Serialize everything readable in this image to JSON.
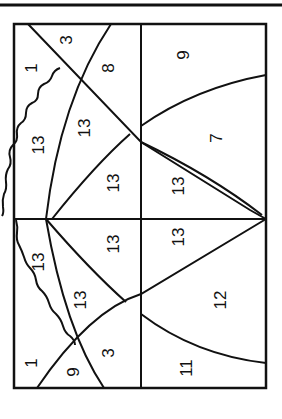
{
  "diagram": {
    "type": "quilt-block-pattern",
    "orientation": "rotated-90",
    "line_color": "#111111",
    "background": "#ffffff",
    "regions": [
      {
        "id": "r1",
        "label": "3",
        "x": 68,
        "y": 40
      },
      {
        "id": "r2",
        "label": "1",
        "x": 33,
        "y": 68
      },
      {
        "id": "r3",
        "label": "8",
        "x": 110,
        "y": 68
      },
      {
        "id": "r4",
        "label": "9",
        "x": 185,
        "y": 55
      },
      {
        "id": "r5",
        "label": "13",
        "x": 40,
        "y": 145
      },
      {
        "id": "r6",
        "label": "13",
        "x": 86,
        "y": 128
      },
      {
        "id": "r7",
        "label": "7",
        "x": 218,
        "y": 138
      },
      {
        "id": "r8",
        "label": "13",
        "x": 115,
        "y": 183
      },
      {
        "id": "r9",
        "label": "13",
        "x": 180,
        "y": 186
      },
      {
        "id": "r10",
        "label": "13",
        "x": 40,
        "y": 262
      },
      {
        "id": "r11",
        "label": "13",
        "x": 115,
        "y": 244
      },
      {
        "id": "r12",
        "label": "13",
        "x": 180,
        "y": 237
      },
      {
        "id": "r13",
        "label": "13",
        "x": 82,
        "y": 300
      },
      {
        "id": "r14",
        "label": "12",
        "x": 222,
        "y": 300
      },
      {
        "id": "r15",
        "label": "3",
        "x": 110,
        "y": 353
      },
      {
        "id": "r16",
        "label": "1",
        "x": 33,
        "y": 363
      },
      {
        "id": "r17",
        "label": "9",
        "x": 75,
        "y": 372
      },
      {
        "id": "r18",
        "label": "11",
        "x": 188,
        "y": 368
      }
    ]
  }
}
